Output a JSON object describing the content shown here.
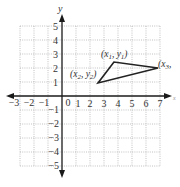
{
  "diagram": {
    "type": "coordinate-plane-triangle",
    "axes": {
      "x_label": "x",
      "y_label": "y",
      "x_range": [
        -3,
        7
      ],
      "y_range": [
        -5,
        5
      ],
      "x_ticks": [
        "−3",
        "−2",
        "−1",
        "0",
        "1",
        "2",
        "3",
        "4",
        "5",
        "6",
        "7"
      ],
      "y_ticks_positive": [
        "5",
        "4",
        "3",
        "2",
        "1"
      ],
      "y_ticks_negative": [
        "−1",
        "−2",
        "−3",
        "−4",
        "−5"
      ],
      "origin_label": "0"
    },
    "grid": true,
    "points": [
      {
        "name": "x1y1",
        "label": "(x",
        "sub1": "1",
        "mid": ", y",
        "sub2": "1",
        "end": ")",
        "x": 3.7,
        "y": 2.4
      },
      {
        "name": "x2y2",
        "label": "(x",
        "sub1": "2",
        "mid": ", y",
        "sub2": "2",
        "end": ")",
        "x": 2.6,
        "y": 0.9
      },
      {
        "name": "x3y3",
        "label": "(x",
        "sub1": "3",
        "mid": ",",
        "sub2": "",
        "end": "",
        "x": 7.0,
        "y": 2.0
      }
    ],
    "colors": {
      "axis": "#1a1a1a",
      "grid": "#a8a8a8",
      "triangle": "#222222",
      "text": "#333333"
    }
  }
}
